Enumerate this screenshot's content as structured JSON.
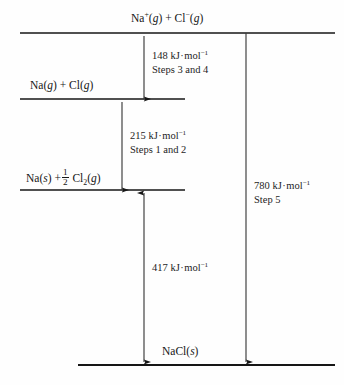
{
  "diagram": {
    "type": "energy-level-diagram",
    "background_color": "#fefefe",
    "line_color": "#161616",
    "levels": [
      {
        "id": "ions-gas",
        "label_plain": "Na+(g) + Cl-(g)",
        "species": "Na",
        "charge": "+",
        "state": "g",
        "species2": "Cl",
        "charge2": "−",
        "state2": "g",
        "y": 33,
        "x_start": 20,
        "x_end": 335
      },
      {
        "id": "atoms-gas",
        "label_plain": "Na(g) + Cl(g)",
        "species": "Na",
        "state": "g",
        "species2": "Cl",
        "state2": "g",
        "y": 99,
        "x_start": 20,
        "x_end": 185
      },
      {
        "id": "elements-standard",
        "label_plain": "Na(s) + 1/2 Cl2(g)",
        "species": "Na",
        "state": "s",
        "frac_num": "1",
        "frac_den": "2",
        "species2": "Cl",
        "sub2": "2",
        "state2": "g",
        "y": 190,
        "x_start": 20,
        "x_end": 185
      },
      {
        "id": "ionic-solid",
        "label_plain": "NaCl(s)",
        "species": "NaCl",
        "state": "s",
        "y": 365,
        "x_start": 78,
        "x_end": 335
      }
    ],
    "arrows": [
      {
        "id": "arrow-148",
        "x": 144,
        "y_from": 99,
        "y_to": 33,
        "head": "up",
        "value": "148",
        "unit": "kJ·mol",
        "exponent": "−1",
        "energy_line": "148 kJ·mol−1",
        "step_line": "Steps 3 and 4",
        "label_x": 152,
        "label_y": 49
      },
      {
        "id": "arrow-215",
        "x": 122,
        "y_from": 190,
        "y_to": 99,
        "head": "up",
        "value": "215",
        "unit": "kJ·mol",
        "exponent": "−1",
        "energy_line": "215 kJ·mol−1",
        "step_line": "Steps 1 and 2",
        "label_x": 130,
        "label_y": 129
      },
      {
        "id": "arrow-417",
        "x": 144,
        "y_from": 365,
        "y_to": 190,
        "head": "both",
        "value": "417",
        "unit": "kJ·mol",
        "exponent": "−1",
        "energy_line": "417 kJ·mol−1",
        "step_line": "",
        "label_x": 152,
        "label_y": 261
      },
      {
        "id": "arrow-780",
        "x": 246,
        "y_from": 33,
        "y_to": 365,
        "head": "down",
        "value": "780",
        "unit": "kJ·mol",
        "exponent": "−1",
        "energy_line": "780 kJ·mol−1",
        "step_line": "Step 5",
        "label_x": 254,
        "label_y": 179
      }
    ]
  },
  "labels": {
    "value_148": "148",
    "value_215": "215",
    "value_417": "417",
    "value_780": "780",
    "unit": "kJ",
    "unit_mol": "mol",
    "exponent": "−1",
    "steps_3_4": "Steps 3 and 4",
    "steps_1_2": "Steps 1 and 2",
    "step_5": "Step 5",
    "na": "Na",
    "cl": "Cl",
    "nacl": "NaCl",
    "plus": "+",
    "minus": "−",
    "state_g": "g",
    "state_s": "s",
    "sub_two": "2",
    "frac_num": "1",
    "frac_den": "2",
    "paren_open": "(",
    "paren_close": ")",
    "plus_sign": "+",
    "cdot": "·"
  }
}
